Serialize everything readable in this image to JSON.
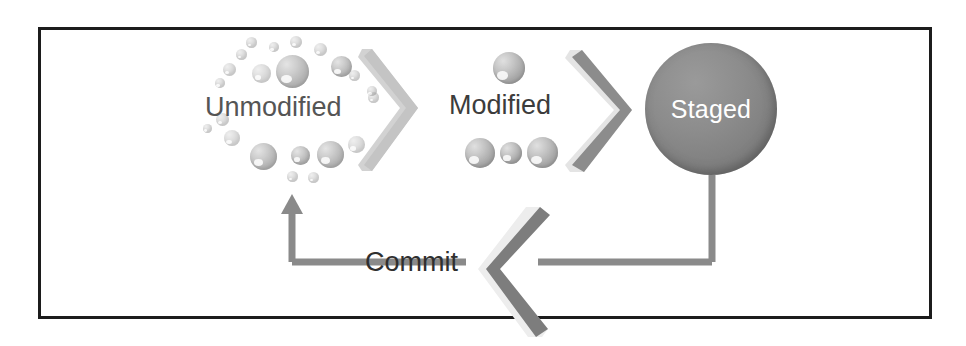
{
  "diagram": {
    "type": "flow-diagram",
    "background_color": "#ffffff",
    "frame_border_color": "#1c1c1c",
    "stages": [
      {
        "id": "unmodified",
        "label": "Unmodified",
        "shape": "sphere-cluster",
        "text_color": "#555555"
      },
      {
        "id": "modified",
        "label": "Modified",
        "shape": "sphere-cluster",
        "text_color": "#3c3c3c"
      },
      {
        "id": "staged",
        "label": "Staged",
        "shape": "filled-circle",
        "fill_color": "#828282",
        "text_color": "#ffffff"
      }
    ],
    "connectors": [
      {
        "id": "arrow-unmodified-to-modified",
        "icon": "chevron-right-icon",
        "label": "",
        "color": "#c9c9c9",
        "direction": "right"
      },
      {
        "id": "arrow-modified-to-staged",
        "icon": "chevron-right-icon",
        "label": "",
        "color": "#8e8e8e",
        "direction": "right"
      },
      {
        "id": "arrow-staged-to-unmodified",
        "icon": "chevron-left-icon",
        "label": "Commit",
        "color": "#7d7d7d",
        "direction": "left"
      }
    ],
    "commit_line": {
      "color": "#8a8a8a",
      "label": "Commit"
    },
    "sphere_color": "#9b9b9b"
  }
}
